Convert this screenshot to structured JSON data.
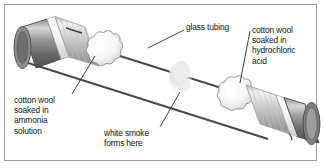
{
  "figure": {
    "border_color": "#9a9a9a",
    "background": "#ffffff"
  },
  "labels": {
    "glass_tubing": "glass tubing",
    "hydrochloric": "cotton wool\nsoaked in\nhydrochloric\nacid",
    "ammonia": "cotton wool\nsoaked in\nammonia\nsolution",
    "smoke": "white smoke\nforms here"
  },
  "parts": {
    "tube_wall_color": "#4a4a4a",
    "cap_dark": "#6b6b6b",
    "cap_light": "#c9c9c9",
    "band_white": "#f4f4f4",
    "cotton_fill": "#fbfbfb",
    "cotton_stroke": "#8c8c8c",
    "smoke_fill": "#e3e5e3",
    "leader_color": "#2c2c2c"
  },
  "icons": {
    "left_stopper": "rubber-bung-icon",
    "right_stopper": "rubber-bung-icon",
    "left_cotton": "cotton-wool-ball-icon",
    "right_cotton": "cotton-wool-ball-icon",
    "smoke_cloud": "smoke-cloud-icon"
  }
}
